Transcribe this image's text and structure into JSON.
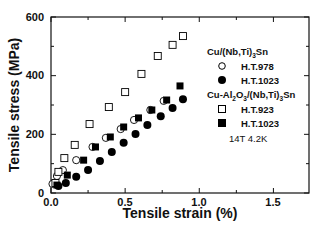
{
  "chart_data": {
    "type": "scatter",
    "title": "",
    "xlabel": "Tensile strain  (%)",
    "ylabel": "Tensile stress  (MPa)",
    "xlim": [
      0,
      1.74
    ],
    "ylim": [
      0,
      600
    ],
    "xticks": [
      0.0,
      0.5,
      1.0,
      1.5
    ],
    "xtick_labels": [
      "0.0",
      "0.5",
      "1.0",
      "1.5"
    ],
    "yticks": [
      0,
      200,
      400,
      600
    ],
    "ytick_labels": [
      "0",
      "200",
      "400",
      "600"
    ],
    "grid": false,
    "legend_position": "upper right (inside)",
    "legend_groups": [
      {
        "title": "Cu/(Nb,Ti)3Sn",
        "title_main": "Cu/(Nb,Ti)",
        "title_sub": "3",
        "title_end": "Sn",
        "entries": [
          {
            "label": "H.T.978",
            "marker": "open-circle"
          },
          {
            "label": "H.T.1023",
            "marker": "filled-circle"
          }
        ]
      },
      {
        "title": "Cu-Al2O3/(Nb,Ti)3Sn",
        "entries": [
          {
            "label": "H.T.923",
            "marker": "open-square"
          },
          {
            "label": "H.T.1023",
            "marker": "filled-square"
          }
        ]
      }
    ],
    "annotation": "14T  4.2K",
    "series": [
      {
        "name": "Cu/(Nb,Ti)3Sn H.T.978",
        "marker": "open-circle",
        "x": [
          0.01,
          0.04,
          0.08,
          0.17,
          0.28,
          0.37,
          0.47,
          0.56,
          0.67,
          0.76
        ],
        "y": [
          31,
          58,
          78,
          112,
          157,
          188,
          218,
          249,
          283,
          314
        ]
      },
      {
        "name": "Cu/(Nb,Ti)3Sn H.T.1023",
        "marker": "filled-circle",
        "x": [
          0.05,
          0.1,
          0.17,
          0.25,
          0.33,
          0.41,
          0.49,
          0.57,
          0.65,
          0.74,
          0.82,
          0.89
        ],
        "y": [
          24,
          34,
          55,
          78,
          109,
          140,
          171,
          201,
          232,
          262,
          290,
          320
        ]
      },
      {
        "name": "Cu-Al2O3/(Nb,Ti)3Sn H.T.923",
        "marker": "open-square",
        "x": [
          0.03,
          0.05,
          0.09,
          0.16,
          0.26,
          0.39,
          0.5,
          0.61,
          0.72,
          0.82,
          0.89
        ],
        "y": [
          34,
          72,
          119,
          164,
          235,
          293,
          344,
          406,
          467,
          505,
          535
        ]
      },
      {
        "name": "Cu-Al2O3/(Nb,Ti)3Sn H.T.1023",
        "marker": "filled-square",
        "x": [
          0.04,
          0.11,
          0.22,
          0.3,
          0.4,
          0.49,
          0.59,
          0.68,
          0.78,
          0.87
        ],
        "y": [
          27,
          61,
          112,
          157,
          191,
          225,
          256,
          283,
          317,
          365
        ]
      }
    ]
  },
  "legend": {
    "group1_title_a": "Cu/(Nb,Ti)",
    "group1_title_sub": "3",
    "group1_title_b": "Sn",
    "group1_entry1": "H.T.978",
    "group1_entry2": "H.T.1023",
    "group2_title_a": "Cu-Al",
    "group2_title_sub1": "2",
    "group2_title_b": "O",
    "group2_title_sub2": "3",
    "group2_title_c": "/(Nb,Ti)",
    "group2_title_sub3": "3",
    "group2_title_d": "Sn",
    "group2_entry1": "H.T.923",
    "group2_entry2": "H.T.1023",
    "note": "14T  4.2K"
  },
  "axes": {
    "xlabel": "Tensile strain  (%)",
    "ylabel": "Tensile stress  (MPa)",
    "x_tick_labels": [
      "0.0",
      "0.5",
      "1.0",
      "1.5"
    ],
    "y_tick_labels": [
      "0",
      "200",
      "400",
      "600"
    ]
  },
  "colors": {
    "axis": "#111111",
    "marker": "#000000",
    "background": "#ffffff"
  }
}
